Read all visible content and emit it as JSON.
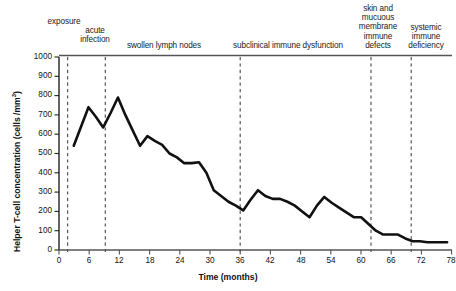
{
  "chart_data": {
    "type": "line",
    "title": "",
    "xlabel": "Time (months)",
    "ylabel": "Helper T-cell concentration (cells /mm3)",
    "ylabel_display": "Helper T-cell concentration (cells /mm³)",
    "xlim": [
      0,
      80
    ],
    "ylim": [
      0,
      1000
    ],
    "grid": false,
    "legend": "none",
    "xticks": [
      0,
      6,
      12,
      18,
      24,
      30,
      36,
      42,
      48,
      54,
      60,
      66,
      72,
      78
    ],
    "yticks": [
      0,
      100,
      200,
      300,
      400,
      500,
      600,
      700,
      800,
      900,
      1000
    ],
    "series_name": "Helper T-cell concentration",
    "line_color": "#111111",
    "x": [
      3,
      4.5,
      6,
      7.5,
      9,
      10.5,
      12,
      13.5,
      15,
      16.5,
      18,
      19.5,
      21,
      22.5,
      24,
      25.5,
      27,
      28.5,
      30,
      31.5,
      33,
      34.5,
      36,
      37.5,
      39,
      40.5,
      42,
      43.5,
      45,
      46.5,
      48,
      49.5,
      51,
      52.5,
      54,
      55.5,
      57,
      58.5,
      60,
      61.5,
      63,
      64.5,
      66,
      67.5,
      69,
      70.5,
      72,
      73.5,
      75,
      76.5,
      78,
      79
    ],
    "values": [
      540,
      640,
      740,
      690,
      635,
      710,
      790,
      700,
      620,
      540,
      590,
      565,
      545,
      500,
      480,
      450,
      450,
      455,
      400,
      310,
      280,
      250,
      230,
      205,
      260,
      310,
      280,
      265,
      265,
      250,
      230,
      200,
      170,
      230,
      275,
      245,
      220,
      195,
      170,
      170,
      135,
      100,
      80,
      80,
      80,
      60,
      45,
      45,
      40,
      40,
      40,
      40
    ],
    "annotations": [
      {
        "label": "exposure",
        "month": 1.7
      },
      {
        "label": "acute\ninfection",
        "month": 9.2
      },
      {
        "label": "swollen lymph nodes",
        "month": 36.0
      },
      {
        "label": "subclinical immune dysfunction",
        "month": 62.0
      },
      {
        "label": "skin and\nmucuous\nmembrane\nimmune\ndefects",
        "month": 70.0
      },
      {
        "label": "systemic\nimmune\ndeficiency",
        "month": 79.5
      }
    ],
    "phase_dividers_months": [
      1.7,
      9.2,
      36.0,
      62.0,
      70.0,
      79.5
    ]
  },
  "stages": [
    {
      "name": "exposure",
      "text": "exposure",
      "left": 33,
      "top": 17,
      "width": 62
    },
    {
      "name": "acute-infection",
      "text": "acute\ninfection",
      "left": 63,
      "top": 26,
      "width": 64
    },
    {
      "name": "swollen-lymph-nodes",
      "text": "swollen lymph nodes",
      "left": 112,
      "top": 40,
      "width": 104
    },
    {
      "name": "subclinical-immune-dysfunction",
      "text": "subclinical immune dysfunction",
      "left": 218,
      "top": 40,
      "width": 140
    },
    {
      "name": "skin-mucuous-membrane-defects",
      "text": "skin and\nmucuous\nmembrane\nimmune\ndefects",
      "left": 355,
      "top": 4,
      "width": 46
    },
    {
      "name": "systemic-immune-deficiency",
      "text": "systemic\nimmune\ndeficiency",
      "left": 399,
      "top": 22,
      "width": 52
    }
  ],
  "axis": {
    "x_title": "Time (months)",
    "y_title_prefix": "Helper T-cell concentration (cells /mm",
    "y_title_sup": "3",
    "y_title_suffix": ")"
  }
}
